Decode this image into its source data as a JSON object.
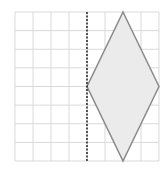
{
  "diagram": {
    "type": "grid-reflection",
    "grid": {
      "columns": 8,
      "rows": 8,
      "line_color": "#d9d9d9"
    },
    "mirror_line": {
      "column_index": 4,
      "style": "dashed",
      "color": "#222222"
    },
    "shape": {
      "name": "rhombus",
      "vertices_grid": [
        [
          6,
          0
        ],
        [
          8,
          4
        ],
        [
          6,
          8
        ],
        [
          4,
          4
        ]
      ],
      "fill": "#ebebeb",
      "stroke": "#8a8a8a"
    }
  }
}
